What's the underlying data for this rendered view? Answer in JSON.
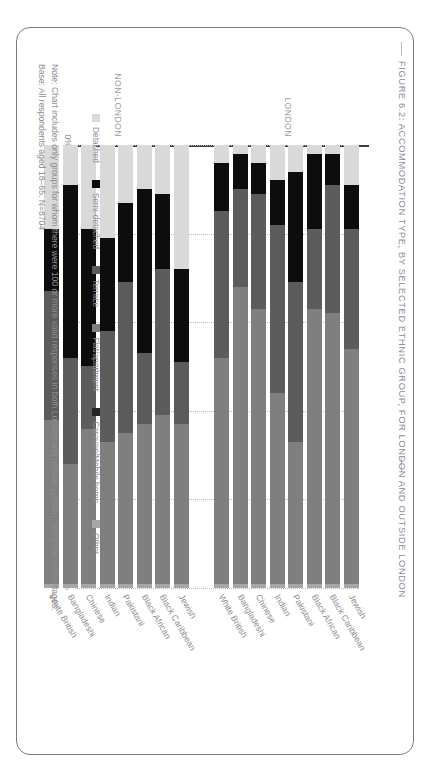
{
  "figure": {
    "title": "FIGURE 6.2: ACCOMMODATION TYPE, BY SELECTED ETHNIC GROUP, FOR LONDON AND OUTSIDE LONDON",
    "notes": [
      "Note: Chart includes only groups for whom there were 100 or more valid responses in both London and outside London. Weighted percentages.",
      "Base: All respondents aged 18–65. N=8704"
    ]
  },
  "groups": [
    {
      "key": "london",
      "label": "LONDON"
    },
    {
      "key": "non_london",
      "label": "NON-LONDON"
    }
  ],
  "colors": {
    "detached": "#d9d9d9",
    "semi_detached": "#0d0d0d",
    "terrace": "#5c5c5c",
    "flat_apartment": "#7f7f7f",
    "caravan_mobile_home": "#262626",
    "other": "#a6a6a6",
    "axis": "#3b3b44",
    "grid": "#b9b9bf",
    "text": "#8c8c93",
    "frame": "#7b7b85"
  },
  "chart_data": {
    "type": "bar",
    "subtype": "stacked-horizontal-100pct",
    "title": "FIGURE 6.2: ACCOMMODATION TYPE, BY SELECTED ETHNIC GROUP, FOR LONDON AND OUTSIDE LONDON",
    "xlabel": "",
    "ylabel": "",
    "ylim": [
      0,
      100
    ],
    "yticks": [
      "0%",
      "20%",
      "40%",
      "60%",
      "80%",
      "100%"
    ],
    "grid": true,
    "legend_position": "bottom",
    "legend": [
      {
        "name": "Detached",
        "color": "#d9d9d9"
      },
      {
        "name": "Semi-detached",
        "color": "#0d0d0d"
      },
      {
        "name": "Terrace",
        "color": "#5c5c5c"
      },
      {
        "name": "Flat/apartment",
        "color": "#7f7f7f"
      },
      {
        "name": "Caravan/Mobile home",
        "color": "#262626"
      },
      {
        "name": "Other",
        "color": "#a6a6a6"
      }
    ],
    "series": [
      {
        "name": "Detached",
        "key": "detached"
      },
      {
        "name": "Semi-detached",
        "key": "semi_detached"
      },
      {
        "name": "Terrace",
        "key": "terrace"
      },
      {
        "name": "Flat/apartment",
        "key": "flat_apartment"
      },
      {
        "name": "Caravan/Mobile home",
        "key": "caravan_mobile_home"
      },
      {
        "name": "Other",
        "key": "other"
      }
    ],
    "panels": [
      {
        "group": "LONDON",
        "categories": [
          "Jewish",
          "Black Caribbean",
          "Black African",
          "Pakistani",
          "Indian",
          "Chinese",
          "Bangladeshi",
          "White British"
        ],
        "rows": [
          {
            "category": "Jewish",
            "values": [
              9,
              10,
              27,
              53,
              0,
              1
            ]
          },
          {
            "category": "Black Caribbean",
            "values": [
              2,
              7,
              29,
              61,
              0,
              1
            ]
          },
          {
            "category": "Black African",
            "values": [
              2,
              17,
              18,
              62,
              0,
              1
            ]
          },
          {
            "category": "Pakistani",
            "values": [
              6,
              25,
              36,
              32,
              0,
              1
            ]
          },
          {
            "category": "Indian",
            "values": [
              8,
              10,
              38,
              43,
              0,
              1
            ]
          },
          {
            "category": "Chinese",
            "values": [
              4,
              7,
              26,
              62,
              0,
              1
            ]
          },
          {
            "category": "Bangladeshi",
            "values": [
              2,
              8,
              22,
              67,
              0,
              1
            ]
          },
          {
            "category": "White British",
            "values": [
              4,
              11,
              33,
              51,
              0,
              1
            ]
          }
        ]
      },
      {
        "group": "NON-LONDON",
        "categories": [
          "Jewish",
          "Black Caribbean",
          "Black African",
          "Pakistani",
          "Indian",
          "Chinese",
          "Bangladeshi",
          "White British"
        ],
        "rows": [
          {
            "category": "Jewish",
            "values": [
              28,
              21,
              14,
              36,
              0,
              1
            ]
          },
          {
            "category": "Black Caribbean",
            "values": [
              11,
              17,
              33,
              38,
              0,
              1
            ]
          },
          {
            "category": "Black African",
            "values": [
              10,
              37,
              16,
              36,
              0,
              1
            ]
          },
          {
            "category": "Pakistani",
            "values": [
              13,
              18,
              34,
              34,
              0,
              1
            ]
          },
          {
            "category": "Indian",
            "values": [
              21,
              21,
              25,
              32,
              0,
              1
            ]
          },
          {
            "category": "Chinese",
            "values": [
              19,
              31,
              14,
              35,
              0,
              1
            ]
          },
          {
            "category": "Bangladeshi",
            "values": [
              9,
              39,
              24,
              27,
              0,
              1
            ]
          },
          {
            "category": "White British",
            "values": [
              19,
              14,
              29,
              37,
              0,
              1
            ]
          }
        ]
      }
    ]
  }
}
